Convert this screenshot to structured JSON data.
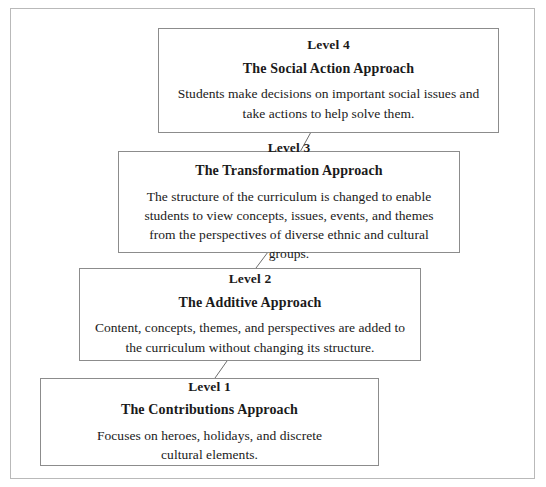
{
  "diagram": {
    "type": "staircase-levels",
    "frame_color": "#b9b9b9",
    "box_border_color": "#8c8c8c",
    "background_color": "#ffffff",
    "text_color": "#1a1a1a",
    "levels": [
      {
        "id": "level-4",
        "title": "Level 4",
        "subtitle": "The Social Action Approach",
        "description": "Students make decisions on important social issues and take actions to help solve them."
      },
      {
        "id": "level-3",
        "title": "Level 3",
        "subtitle": "The Transformation Approach",
        "description": "The structure of the curriculum is changed to enable students to view concepts, issues, events, and themes from the perspectives of diverse ethnic and cultural groups."
      },
      {
        "id": "level-2",
        "title": "Level 2",
        "subtitle": "The Additive Approach",
        "description": "Content, concepts, themes, and perspectives are added to the curriculum without changing its structure."
      },
      {
        "id": "level-1",
        "title": "Level 1",
        "subtitle": "The Contributions Approach",
        "description": "Focuses on heroes, holidays, and discrete cultural elements."
      }
    ],
    "connectors": [
      {
        "id": "connector-4-3",
        "from": "level-3",
        "to": "level-4",
        "x1": 300,
        "y1": 152,
        "x2": 311,
        "y2": 132
      },
      {
        "id": "connector-3-2",
        "from": "level-2",
        "to": "level-3",
        "x1": 256,
        "y1": 268,
        "x2": 268,
        "y2": 252
      },
      {
        "id": "connector-2-1",
        "from": "level-1",
        "to": "level-2",
        "x1": 215,
        "y1": 378,
        "x2": 227,
        "y2": 361
      }
    ]
  }
}
